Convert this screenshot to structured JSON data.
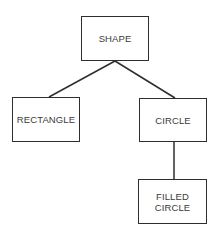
{
  "diagram": {
    "type": "hierarchy-tree",
    "colors": {
      "stroke": "#2e2e2e",
      "text": "#3a3a3a",
      "background": "#ffffff"
    },
    "nodes": [
      {
        "id": "shape",
        "label": "SHAPE",
        "x": 81,
        "y": 16,
        "w": 68,
        "h": 45
      },
      {
        "id": "rectangle",
        "label": "RECTANGLE",
        "x": 12,
        "y": 97,
        "w": 68,
        "h": 45
      },
      {
        "id": "circle",
        "label": "CIRCLE",
        "x": 139,
        "y": 98,
        "w": 68,
        "h": 44
      },
      {
        "id": "filled-circle",
        "label": "FILLED\nCIRCLE",
        "x": 138,
        "y": 179,
        "w": 69,
        "h": 45
      }
    ],
    "edges": [
      {
        "from": "shape",
        "to": "rectangle"
      },
      {
        "from": "shape",
        "to": "circle"
      },
      {
        "from": "circle",
        "to": "filled-circle"
      }
    ]
  }
}
